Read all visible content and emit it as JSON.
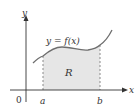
{
  "diagram": {
    "type": "area-under-curve",
    "curve_label": "y = f(x)",
    "region_label": "R",
    "axis_labels": {
      "x": "x",
      "y": "y"
    },
    "origin_label": "0",
    "bounds": {
      "a": "a",
      "b": "b"
    },
    "colors": {
      "axis": "#333333",
      "curve": "#6e6e6e",
      "region_fill": "#e6e6e6",
      "dashed": "#8a8a8a"
    }
  }
}
